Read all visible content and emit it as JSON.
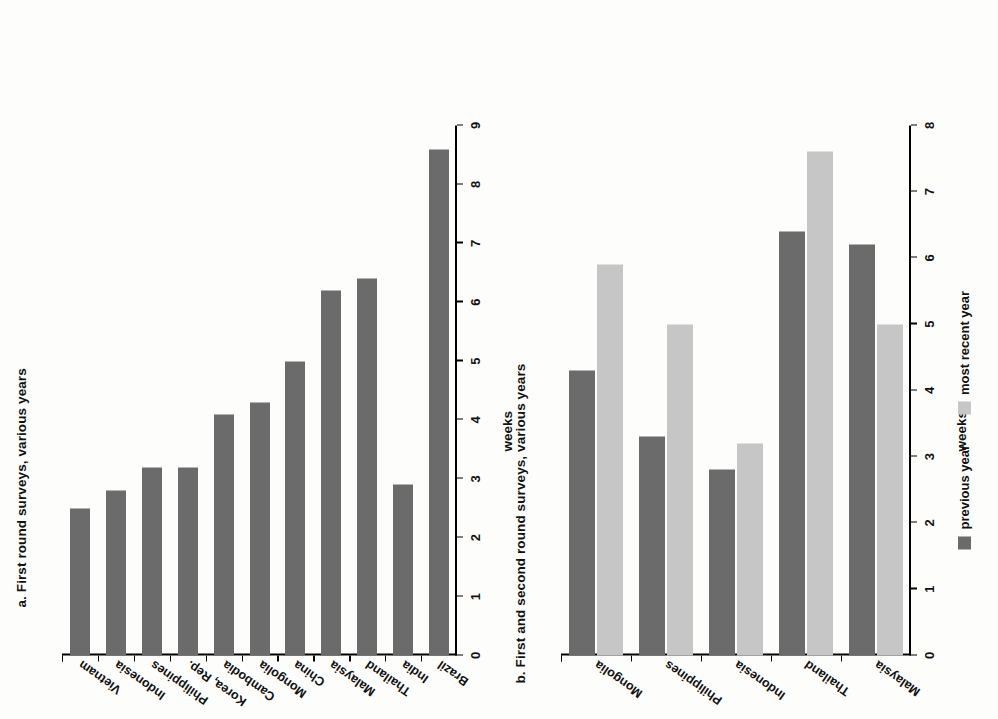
{
  "figure": {
    "panels": [
      {
        "id": "a",
        "title": "a. First round surveys, various years",
        "axis_title": "weeks"
      },
      {
        "id": "b",
        "title": "b. First and second round surveys, various years",
        "axis_title": "weeks"
      }
    ],
    "legend": {
      "items": [
        {
          "label": "previous year",
          "color": "#6b6b6b",
          "swatch_name": "previous-year-swatch"
        },
        {
          "label": "most recent year",
          "color": "#c6c6c6",
          "swatch_name": "most-recent-year-swatch"
        }
      ]
    },
    "brackets": [
      {
        "label": "East Asia",
        "from": 0,
        "to": 8
      },
      {
        "label": "other",
        "from": 9,
        "to": 10
      }
    ]
  },
  "chart_data": [
    {
      "type": "bar",
      "id": "a",
      "title": "a. First round surveys, various years",
      "xlabel": "",
      "ylabel": "weeks",
      "ylim": [
        0,
        9
      ],
      "yticks": [
        0,
        1,
        2,
        3,
        4,
        5,
        6,
        7,
        8,
        9
      ],
      "grid": false,
      "orientation": "vertical",
      "categories": [
        "Vietnam",
        "Indonesia",
        "Philippines",
        "Korea, Rep.",
        "Cambodia",
        "Mongolia",
        "China",
        "Malaysia",
        "Thailand",
        "India",
        "Brazil"
      ],
      "values": [
        2.5,
        2.8,
        3.2,
        3.2,
        4.1,
        4.3,
        5.0,
        6.2,
        6.4,
        2.9,
        8.6
      ],
      "series": [
        {
          "name": "first round",
          "color": "#6b6b6b",
          "values": [
            2.5,
            2.8,
            3.2,
            3.2,
            4.1,
            4.3,
            5.0,
            6.2,
            6.4,
            2.9,
            8.6
          ]
        }
      ],
      "groups": [
        {
          "label": "East Asia",
          "categories": [
            "Vietnam",
            "Indonesia",
            "Philippines",
            "Korea, Rep.",
            "Cambodia",
            "Mongolia",
            "China",
            "Malaysia",
            "Thailand"
          ]
        },
        {
          "label": "other",
          "categories": [
            "India",
            "Brazil"
          ]
        }
      ]
    },
    {
      "type": "bar",
      "id": "b",
      "title": "b. First and second round surveys, various years",
      "xlabel": "",
      "ylabel": "weeks",
      "ylim": [
        0,
        8
      ],
      "yticks": [
        0,
        1,
        2,
        3,
        4,
        5,
        6,
        7,
        8
      ],
      "grid": false,
      "orientation": "vertical",
      "legend_position": "bottom",
      "categories": [
        "Mongolia",
        "Philippines",
        "Indonesia",
        "Thailand",
        "Malaysia"
      ],
      "series": [
        {
          "name": "previous year",
          "color": "#6b6b6b",
          "values": [
            4.3,
            3.3,
            2.8,
            6.4,
            6.2
          ]
        },
        {
          "name": "most recent year",
          "color": "#c6c6c6",
          "values": [
            5.9,
            5.0,
            3.2,
            7.6,
            5.0
          ]
        }
      ]
    }
  ]
}
